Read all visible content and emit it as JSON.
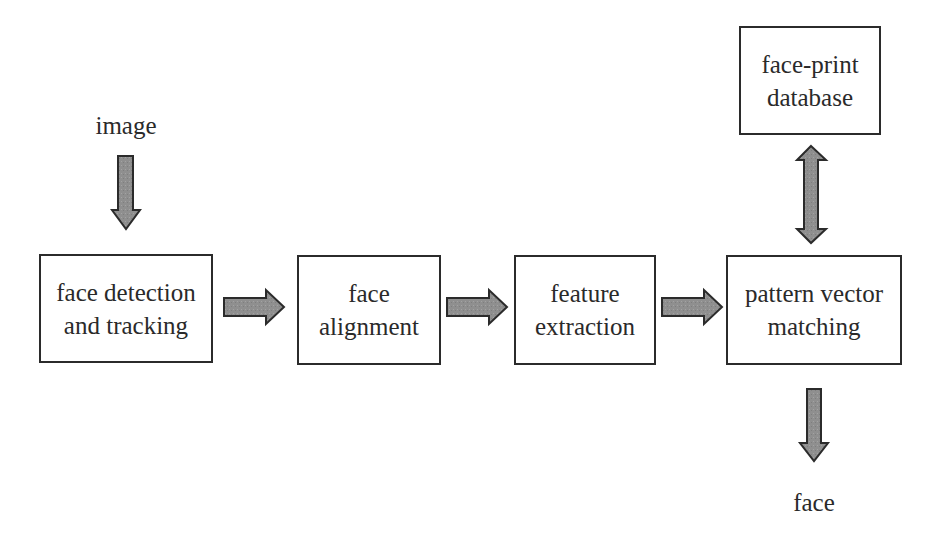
{
  "diagram": {
    "type": "flowchart",
    "colors": {
      "box_border": "#2b2b2b",
      "arrow_fill": "#8f8f8f",
      "arrow_stroke": "#2b2b2b",
      "text": "#2a2a2a"
    },
    "input_label": "image",
    "output_label": "face",
    "nodes": [
      {
        "id": "detect",
        "line1": "face detection",
        "line2": "and tracking"
      },
      {
        "id": "align",
        "line1": "face",
        "line2": "alignment"
      },
      {
        "id": "extract",
        "line1": "feature",
        "line2": "extraction"
      },
      {
        "id": "match",
        "line1": "pattern vector",
        "line2": "matching"
      },
      {
        "id": "db",
        "line1": "face-print",
        "line2": "database"
      }
    ],
    "edges": [
      {
        "from": "image",
        "to": "detect",
        "type": "single"
      },
      {
        "from": "detect",
        "to": "align",
        "type": "single"
      },
      {
        "from": "align",
        "to": "extract",
        "type": "single"
      },
      {
        "from": "extract",
        "to": "match",
        "type": "single"
      },
      {
        "from": "match",
        "to": "db",
        "type": "bidirectional"
      },
      {
        "from": "match",
        "to": "face",
        "type": "single"
      }
    ]
  }
}
